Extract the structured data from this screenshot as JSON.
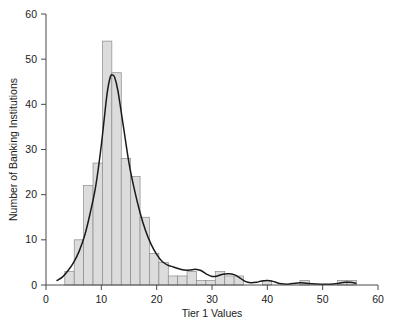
{
  "chart_data": {
    "type": "bar",
    "title": "",
    "subtitle": "",
    "xlabel": "Tier 1 Values",
    "ylabel": "Number of Banking Institutions",
    "xlim": [
      0,
      60
    ],
    "ylim": [
      0,
      60
    ],
    "xticks": [
      0,
      10,
      20,
      30,
      40,
      50,
      60
    ],
    "yticks": [
      0,
      10,
      20,
      30,
      40,
      50,
      60
    ],
    "xtick_labels": [
      "0",
      "10",
      "20",
      "30",
      "40",
      "50",
      "60"
    ],
    "ytick_labels": [
      "0",
      "10",
      "20",
      "30",
      "40",
      "50",
      "60"
    ],
    "grid": false,
    "legend": null,
    "bin_width": 1.7,
    "bin_starts": [
      3.4,
      5.1,
      6.8,
      8.5,
      10.2,
      11.9,
      13.6,
      15.3,
      17.0,
      18.7,
      20.4,
      22.1,
      23.8,
      25.5,
      27.2,
      28.9,
      30.6,
      32.3,
      34.0,
      35.7,
      37.4,
      39.1,
      40.8,
      42.5,
      44.2,
      45.9,
      47.6,
      49.3,
      51.0,
      52.7,
      54.4
    ],
    "bin_centers": [
      4.25,
      5.95,
      7.65,
      9.35,
      11.05,
      12.75,
      14.45,
      16.15,
      17.85,
      19.55,
      21.25,
      22.95,
      24.65,
      26.35,
      28.05,
      29.75,
      31.45,
      33.15,
      34.85,
      36.55,
      38.25,
      39.95,
      41.65,
      43.35,
      45.05,
      46.75,
      48.45,
      50.15,
      51.85,
      53.55,
      55.25
    ],
    "values": [
      3,
      10,
      22,
      27,
      54,
      47,
      28,
      24,
      15,
      7,
      5,
      2,
      2,
      3,
      1,
      1,
      3,
      2,
      2,
      0,
      0,
      1,
      0,
      0,
      0,
      1,
      0,
      0,
      0,
      1,
      1
    ],
    "series": [
      {
        "name": "Histogram of Tier 1 Values",
        "type": "bar",
        "values": [
          3,
          10,
          22,
          27,
          54,
          47,
          28,
          24,
          15,
          7,
          5,
          2,
          2,
          3,
          1,
          1,
          3,
          2,
          2,
          0,
          0,
          1,
          0,
          0,
          0,
          1,
          0,
          0,
          0,
          1,
          1
        ],
        "fill_color": "#dcdcdc",
        "edge_color": "#8a8a8a"
      },
      {
        "name": "Density curve",
        "type": "line",
        "color": "#1a1a1a",
        "x": [
          2.0,
          3.0,
          4.0,
          5.0,
          6.0,
          7.0,
          8.0,
          9.0,
          10.0,
          11.0,
          11.6,
          12.0,
          12.4,
          13.0,
          14.0,
          15.0,
          16.0,
          17.0,
          18.0,
          19.0,
          20.0,
          21.0,
          22.0,
          23.0,
          24.0,
          25.0,
          26.0,
          27.0,
          28.0,
          29.0,
          30.0,
          31.0,
          32.0,
          33.0,
          34.0,
          35.0,
          36.0,
          37.0,
          38.0,
          39.0,
          40.0,
          41.0,
          42.0,
          43.0,
          44.0,
          45.0,
          46.0,
          47.0,
          48.0,
          49.0,
          50.0,
          51.0,
          52.0,
          53.0,
          54.0,
          55.0,
          56.0
        ],
        "y": [
          1.0,
          1.8,
          3.2,
          5.0,
          7.5,
          11.0,
          16.0,
          22.0,
          31.0,
          42.0,
          46.0,
          46.5,
          46.0,
          43.0,
          35.0,
          27.0,
          21.0,
          16.0,
          12.0,
          9.0,
          6.8,
          5.2,
          4.4,
          4.0,
          3.6,
          3.3,
          3.3,
          3.5,
          3.2,
          2.4,
          1.9,
          2.0,
          2.4,
          2.5,
          2.3,
          1.6,
          0.8,
          0.5,
          0.6,
          0.9,
          1.0,
          0.8,
          0.4,
          0.2,
          0.2,
          0.4,
          0.5,
          0.4,
          0.3,
          0.2,
          0.15,
          0.15,
          0.2,
          0.4,
          0.6,
          0.6,
          0.4
        ]
      }
    ]
  },
  "axes": {
    "x_title": "Tier 1 Values",
    "y_title": "Number of Banking Institutions"
  },
  "colors": {
    "bar_fill": "#dcdcdc",
    "bar_edge": "#8a8a8a",
    "curve": "#1a1a1a",
    "axis": "#4a4a4a",
    "background": "#ffffff"
  }
}
